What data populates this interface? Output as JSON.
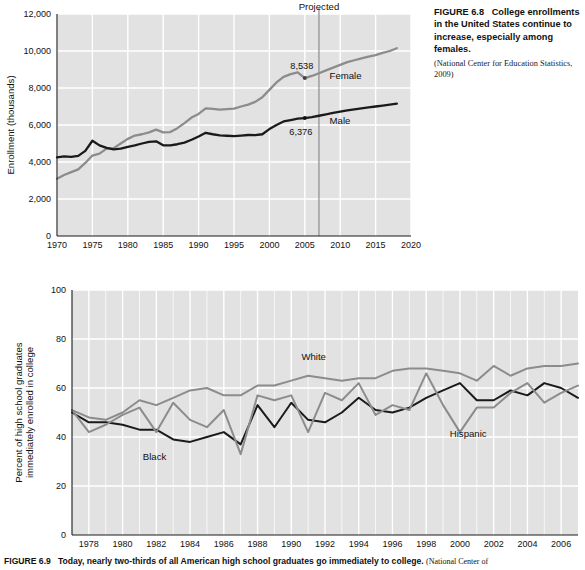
{
  "figure_68": {
    "caption_label": "FIGURE 6.8",
    "caption_text": "College enrollments in the United States continue to increase, especially among females.",
    "caption_source": "(National Center for Education Statistics, 2009)",
    "projected_label": "Projected",
    "projected_year": 2007,
    "annotations": [
      {
        "name": "female-value",
        "text": "8,538",
        "year": 2005,
        "value": 8538
      },
      {
        "name": "male-value",
        "text": "6,376",
        "year": 2005,
        "value": 6376
      }
    ],
    "series_labels": {
      "female": "Female",
      "male": "Male"
    }
  },
  "figure_69": {
    "caption_label": "FIGURE 6.9",
    "caption_text": "Today, nearly two-thirds of all American high school graduates go immediately to college.",
    "caption_source": "(National Center of",
    "series_labels": {
      "white": "White",
      "black": "Black",
      "hispanic": "Hispanic"
    }
  },
  "colors": {
    "plot_background": "#e2e2e2",
    "gridline": "#ffffff",
    "dark_series": "#1a1a1a",
    "gray_series": "#8c8c8c",
    "axis": "#1b1b1b",
    "text": "#111111",
    "projected_rule": "#8c8c8c"
  },
  "chart_data": [
    {
      "type": "line",
      "name": "college-enrollment-by-sex",
      "title": "College enrollments in the United States",
      "xlabel": "",
      "ylabel": "Enrollment (thousands)",
      "xlim": [
        1970,
        2020
      ],
      "ylim": [
        0,
        12000
      ],
      "xticks": [
        1970,
        1975,
        1980,
        1985,
        1990,
        1995,
        2000,
        2005,
        2010,
        2015,
        2020
      ],
      "yticks": [
        0,
        2000,
        4000,
        6000,
        8000,
        10000,
        12000
      ],
      "ytick_labels": [
        "0",
        "2,000",
        "4,000",
        "6,000",
        "8,000",
        "10,000",
        "12,000"
      ],
      "grid": true,
      "legend": "inline-labels",
      "annotations": [
        {
          "text": "Projected",
          "x": 2007,
          "type": "vline"
        },
        {
          "text": "8,538",
          "x": 2005,
          "y": 8538,
          "series": "Female"
        },
        {
          "text": "6,376",
          "x": 2005,
          "y": 6376,
          "series": "Male"
        }
      ],
      "x": [
        1970,
        1971,
        1972,
        1973,
        1974,
        1975,
        1976,
        1977,
        1978,
        1979,
        1980,
        1981,
        1982,
        1983,
        1984,
        1985,
        1986,
        1987,
        1988,
        1989,
        1990,
        1991,
        1992,
        1993,
        1994,
        1995,
        1996,
        1997,
        1998,
        1999,
        2000,
        2001,
        2002,
        2003,
        2004,
        2005,
        2006,
        2007,
        2008,
        2009,
        2010,
        2011,
        2012,
        2013,
        2014,
        2015,
        2016,
        2017,
        2018
      ],
      "series": [
        {
          "name": "Female",
          "color": "#8c8c8c",
          "values": [
            3100,
            3300,
            3450,
            3600,
            3950,
            4350,
            4450,
            4720,
            4750,
            5000,
            5250,
            5430,
            5500,
            5600,
            5750,
            5600,
            5620,
            5830,
            6100,
            6400,
            6600,
            6900,
            6870,
            6830,
            6860,
            6890,
            7000,
            7100,
            7250,
            7500,
            7900,
            8300,
            8600,
            8750,
            8850,
            8538,
            8650,
            8800,
            8950,
            9100,
            9250,
            9400,
            9500,
            9600,
            9700,
            9780,
            9900,
            10000,
            10150
          ]
        },
        {
          "name": "Male",
          "color": "#1a1a1a",
          "values": [
            4250,
            4300,
            4280,
            4330,
            4600,
            5150,
            4900,
            4760,
            4680,
            4720,
            4820,
            4900,
            5000,
            5090,
            5120,
            4900,
            4900,
            4960,
            5050,
            5200,
            5380,
            5580,
            5500,
            5440,
            5420,
            5400,
            5430,
            5460,
            5450,
            5500,
            5780,
            6000,
            6190,
            6270,
            6340,
            6376,
            6420,
            6500,
            6580,
            6650,
            6720,
            6790,
            6850,
            6900,
            6950,
            7000,
            7050,
            7100,
            7150
          ]
        }
      ]
    },
    {
      "type": "line",
      "name": "hs-graduates-enrolled-by-race",
      "title": "Percent of high school graduates immediately enrolled in college",
      "xlabel": "",
      "ylabel": "Percent of high school graduates immediately enrolled in college",
      "xlim": [
        1977,
        2007
      ],
      "ylim": [
        0,
        100
      ],
      "xticks": [
        1978,
        1980,
        1982,
        1984,
        1986,
        1988,
        1990,
        1992,
        1994,
        1996,
        1998,
        2000,
        2002,
        2004,
        2006
      ],
      "yticks": [
        0,
        20,
        40,
        60,
        80,
        100
      ],
      "ytick_labels": [
        "0",
        "20",
        "40",
        "60",
        "80",
        "100"
      ],
      "grid": true,
      "legend": "inline-labels",
      "x": [
        1977,
        1978,
        1979,
        1980,
        1981,
        1982,
        1983,
        1984,
        1985,
        1986,
        1987,
        1988,
        1989,
        1990,
        1991,
        1992,
        1993,
        1994,
        1995,
        1996,
        1997,
        1998,
        1999,
        2000,
        2001,
        2002,
        2003,
        2004,
        2005,
        2006,
        2007
      ],
      "series": [
        {
          "name": "White",
          "color": "#8c8c8c",
          "values": [
            51,
            48,
            47,
            50,
            55,
            53,
            56,
            59,
            60,
            57,
            57,
            61,
            61,
            63,
            65,
            64,
            63,
            64,
            64,
            67,
            68,
            68,
            67,
            66,
            63,
            69,
            65,
            68,
            69,
            69,
            70
          ]
        },
        {
          "name": "Black",
          "color": "#1a1a1a",
          "values": [
            50,
            46,
            46,
            45,
            43,
            43,
            39,
            38,
            40,
            42,
            37,
            53,
            44,
            54,
            47,
            46,
            50,
            56,
            51,
            50,
            52,
            56,
            59,
            62,
            55,
            55,
            59,
            57,
            62,
            60,
            56
          ]
        },
        {
          "name": "Hispanic",
          "color": "#8c8c8c",
          "values": [
            51,
            42,
            45,
            49,
            52,
            42,
            54,
            47,
            44,
            51,
            33,
            57,
            55,
            57,
            42,
            58,
            55,
            62,
            49,
            53,
            51,
            66,
            53,
            42,
            52,
            52,
            58,
            62,
            54,
            58,
            61
          ]
        }
      ]
    }
  ]
}
